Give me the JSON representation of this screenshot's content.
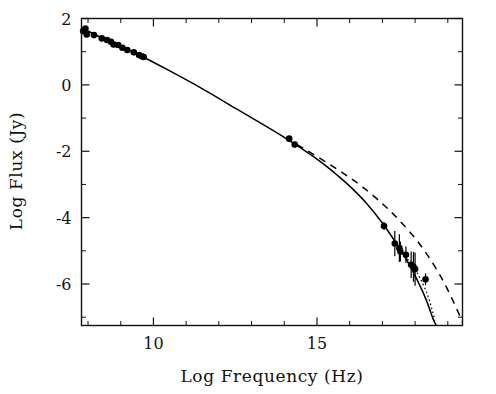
{
  "figure": {
    "name": "spectral-energy-distribution",
    "background_color": "#ffffff",
    "ink_color": "#000000"
  },
  "chart_data": {
    "type": "scatter",
    "title": "",
    "subtitle": "",
    "xlabel": "Log Frequency (Hz)",
    "ylabel": "Log Flux (Jy)",
    "xlim": [
      7.8,
      19.45
    ],
    "ylim": [
      -7.25,
      2.0
    ],
    "grid": false,
    "legend": "none",
    "xticks_major": [
      10,
      15,
      20
    ],
    "xtick_labels": [
      "10",
      "15",
      "20"
    ],
    "xticks_minor": [
      8,
      9,
      11,
      12,
      13,
      14,
      16,
      17,
      18,
      19
    ],
    "yticks_major": [
      2,
      0,
      -2,
      -4,
      -6
    ],
    "ytick_labels": [
      "2",
      "0",
      "-2",
      "-4",
      "-6"
    ],
    "yticks_minor": [
      1,
      -1,
      -3,
      -5,
      -7
    ],
    "series": [
      {
        "name": "radio data",
        "type": "scatter",
        "marker": "filled-circle",
        "points": [
          {
            "x": 7.85,
            "y": 1.62
          },
          {
            "x": 7.92,
            "y": 1.7
          },
          {
            "x": 7.96,
            "y": 1.52
          },
          {
            "x": 8.18,
            "y": 1.5
          },
          {
            "x": 8.42,
            "y": 1.4
          },
          {
            "x": 8.58,
            "y": 1.35
          },
          {
            "x": 8.7,
            "y": 1.3
          },
          {
            "x": 8.78,
            "y": 1.22
          },
          {
            "x": 8.92,
            "y": 1.2
          },
          {
            "x": 9.05,
            "y": 1.12
          },
          {
            "x": 9.2,
            "y": 1.05
          },
          {
            "x": 9.4,
            "y": 0.98
          },
          {
            "x": 9.56,
            "y": 0.9
          },
          {
            "x": 9.64,
            "y": 0.86
          },
          {
            "x": 9.7,
            "y": 0.84
          }
        ]
      },
      {
        "name": "optical data",
        "type": "scatter",
        "marker": "filled-circle",
        "points": [
          {
            "x": 14.15,
            "y": -1.62
          },
          {
            "x": 14.32,
            "y": -1.8
          }
        ]
      },
      {
        "name": "x-ray data",
        "type": "scatter-errorbar",
        "marker": "filled-circle",
        "points": [
          {
            "x": 17.05,
            "y": -4.25,
            "yerr": 0.12
          },
          {
            "x": 17.38,
            "y": -4.78,
            "yerr": 0.38
          },
          {
            "x": 17.52,
            "y": -4.92,
            "yerr": 0.42
          },
          {
            "x": 17.55,
            "y": -5.02,
            "yerr": 0.3
          },
          {
            "x": 17.72,
            "y": -5.12,
            "yerr": 0.25
          },
          {
            "x": 17.88,
            "y": -5.42,
            "yerr": 0.4
          },
          {
            "x": 17.95,
            "y": -5.48,
            "yerr": 0.45
          },
          {
            "x": 18.0,
            "y": -5.55,
            "yerr": 0.5
          },
          {
            "x": 18.32,
            "y": -5.86,
            "yerr": 0.18
          }
        ]
      },
      {
        "name": "model solid",
        "type": "line",
        "style": "solid",
        "points": [
          {
            "x": 7.8,
            "y": 1.72
          },
          {
            "x": 8.5,
            "y": 1.38
          },
          {
            "x": 9.5,
            "y": 0.93
          },
          {
            "x": 10.5,
            "y": 0.42
          },
          {
            "x": 11.5,
            "y": -0.12
          },
          {
            "x": 12.5,
            "y": -0.7
          },
          {
            "x": 13.5,
            "y": -1.28
          },
          {
            "x": 14.0,
            "y": -1.58
          },
          {
            "x": 14.5,
            "y": -1.9
          },
          {
            "x": 15.0,
            "y": -2.24
          },
          {
            "x": 15.5,
            "y": -2.62
          },
          {
            "x": 16.0,
            "y": -3.05
          },
          {
            "x": 16.5,
            "y": -3.55
          },
          {
            "x": 17.0,
            "y": -4.16
          },
          {
            "x": 17.4,
            "y": -4.74
          },
          {
            "x": 17.8,
            "y": -5.38
          },
          {
            "x": 18.1,
            "y": -5.95
          },
          {
            "x": 18.35,
            "y": -6.5
          },
          {
            "x": 18.55,
            "y": -7.05
          },
          {
            "x": 18.65,
            "y": -7.25
          }
        ]
      },
      {
        "name": "model dashed",
        "type": "line",
        "style": "dashed",
        "points": [
          {
            "x": 14.05,
            "y": -1.6
          },
          {
            "x": 14.6,
            "y": -1.92
          },
          {
            "x": 15.2,
            "y": -2.28
          },
          {
            "x": 15.8,
            "y": -2.66
          },
          {
            "x": 16.4,
            "y": -3.08
          },
          {
            "x": 17.0,
            "y": -3.58
          },
          {
            "x": 17.5,
            "y": -4.06
          },
          {
            "x": 18.0,
            "y": -4.62
          },
          {
            "x": 18.4,
            "y": -5.16
          },
          {
            "x": 18.8,
            "y": -5.8
          },
          {
            "x": 19.1,
            "y": -6.38
          },
          {
            "x": 19.35,
            "y": -6.92
          },
          {
            "x": 19.45,
            "y": -7.15
          }
        ]
      },
      {
        "name": "model dotted",
        "type": "line",
        "style": "dotted",
        "points": [
          {
            "x": 17.6,
            "y": -5.05
          },
          {
            "x": 17.9,
            "y": -5.42
          },
          {
            "x": 18.15,
            "y": -5.82
          },
          {
            "x": 18.38,
            "y": -6.32
          },
          {
            "x": 18.52,
            "y": -6.78
          },
          {
            "x": 18.6,
            "y": -7.1
          }
        ]
      }
    ]
  }
}
